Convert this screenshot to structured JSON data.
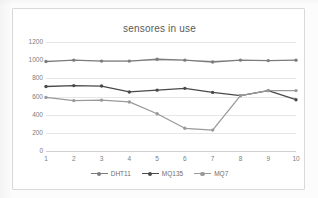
{
  "chart_data": {
    "type": "line",
    "title": "sensores in use",
    "xlabel": "",
    "ylabel": "",
    "categories": [
      "1",
      "2",
      "3",
      "4",
      "5",
      "6",
      "7",
      "8",
      "9",
      "10"
    ],
    "ylim": [
      0,
      1200
    ],
    "yticks": [
      0,
      200,
      400,
      600,
      800,
      1000,
      1200
    ],
    "ytick_labels": [
      "0",
      "200",
      "400",
      "600",
      "800",
      "1000",
      "1200"
    ],
    "grid": true,
    "legend_position": "bottom",
    "series": [
      {
        "name": "DHT11",
        "color": "#7c7c7c",
        "values": [
          985,
          1000,
          990,
          990,
          1010,
          1000,
          980,
          1000,
          995,
          1000
        ]
      },
      {
        "name": "MQ135",
        "color": "#4a4a4a",
        "values": [
          710,
          720,
          715,
          650,
          670,
          690,
          645,
          610,
          665,
          565
        ]
      },
      {
        "name": "MQ7",
        "color": "#9a9a9a",
        "values": [
          590,
          555,
          560,
          540,
          410,
          250,
          230,
          610,
          665,
          665
        ]
      }
    ]
  },
  "legend": {
    "items": [
      {
        "label": "DHT11"
      },
      {
        "label": "MQ135"
      },
      {
        "label": "MQ7"
      }
    ]
  }
}
